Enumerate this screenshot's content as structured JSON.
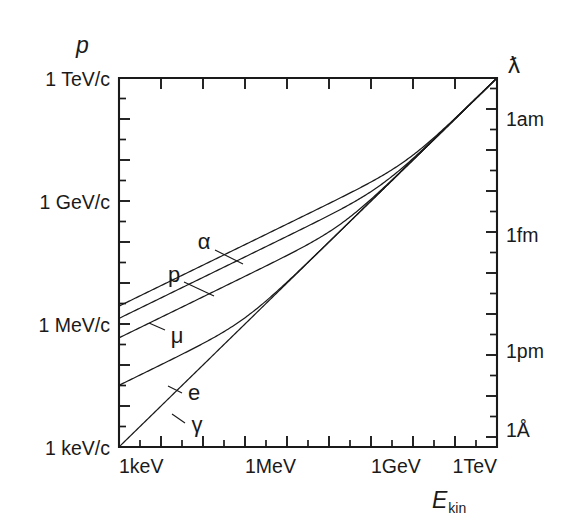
{
  "figure": {
    "background_color": "#ffffff",
    "line_color": "#1a1a1a"
  },
  "axes": {
    "y_left": {
      "title": "p",
      "labels": [
        "1 TeV/c",
        "1 GeV/c",
        "1 MeV/c",
        "1 keV/c"
      ],
      "decade_values": [
        1000000000,
        1000000,
        1000,
        1
      ]
    },
    "y_right": {
      "title": "ƛ",
      "labels": [
        "1am",
        "1fm",
        "1pm",
        "1Å"
      ]
    },
    "x_bottom": {
      "title_main": "E",
      "title_sub": "kin",
      "labels": [
        "1keV",
        "1MeV",
        "1GeV",
        "1TeV"
      ]
    }
  },
  "curve_labels": {
    "alpha": "α",
    "proton": "p",
    "muon": "μ",
    "electron": "e",
    "photon": "γ"
  },
  "chart_data": {
    "type": "line",
    "title": "",
    "xlabel": "E_kin",
    "ylabel": "p",
    "xscale": "log",
    "yscale": "log",
    "xlim": [
      1000,
      1000000000000
    ],
    "ylim": [
      1000,
      1000000000000
    ],
    "xtick_labels": [
      "1keV",
      "1MeV",
      "1GeV",
      "1TeV"
    ],
    "xtick_values": [
      1000,
      1000000,
      1000000000,
      1000000000000
    ],
    "ytick_labels": [
      "1 keV/c",
      "1 MeV/c",
      "1 GeV/c",
      "1 TeV/c"
    ],
    "ytick_values": [
      1000,
      1000000,
      1000000000,
      1000000000000
    ],
    "y2tick_labels": [
      "1Å",
      "1pm",
      "1fm",
      "1am"
    ],
    "grid": false,
    "legend": "inline-curve-labels",
    "minor_ticks_per_decade": 1,
    "note": "Momentum p = sqrt(T^2 + 2*T*m*c^2)/c versus kinetic energy T for five particles; right axis is reduced wavelength lambda-bar = hbar/p.",
    "series": [
      {
        "name": "α",
        "rest_mass_MeV": 3727.0,
        "x": [
          1000,
          3162,
          10000,
          31620,
          100000,
          316200,
          1000000,
          3162000,
          10000000,
          31620000,
          100000000,
          316200000,
          1000000000,
          3162000000,
          10000000000,
          31620000000,
          100000000000,
          316200000000,
          1000000000000
        ],
        "y": [
          2730000,
          4855000,
          8634000,
          15350000,
          27300000,
          48550000,
          86340000,
          153500000,
          273000000,
          485800000,
          866200000,
          1560000000,
          2880000000,
          5730000000,
          13120000000,
          34700000000,
          103000000000,
          317000000000,
          1000000000000
        ]
      },
      {
        "name": "p",
        "rest_mass_MeV": 938.3,
        "x": [
          1000,
          3162,
          10000,
          31620,
          100000,
          316200,
          1000000,
          3162000,
          10000000,
          31620000,
          100000000,
          316200000,
          1000000000,
          3162000000,
          10000000000,
          31620000000,
          100000000000,
          316200000000,
          1000000000000
        ],
        "y": [
          1370000,
          2436000,
          4332000,
          7702000,
          13700000,
          24360000,
          43330000,
          77060000,
          137100000,
          243900000,
          435300000,
          783600000,
          1452000000,
          3040000000,
          8000000000,
          26900000000,
          96100000000,
          314000000000,
          1000000000000
        ]
      },
      {
        "name": "μ",
        "rest_mass_MeV": 105.66,
        "x": [
          1000,
          3162,
          10000,
          31620,
          100000,
          316200,
          1000000,
          3162000,
          10000000,
          31620000,
          100000000,
          316200000,
          1000000000,
          3162000000,
          10000000000,
          31620000000,
          100000000000,
          316200000000,
          1000000000000
        ],
        "y": [
          460000,
          818000,
          1454000,
          2585000,
          4598000,
          8175000,
          14540000,
          25860000,
          46060000,
          82130000,
          147300000,
          272800000,
          557900000,
          1400000000,
          4620000000,
          20500000000,
          89400000000,
          310000000000,
          1000000000000
        ]
      },
      {
        "name": "e",
        "rest_mass_MeV": 0.511,
        "x": [
          1000,
          3162,
          10000,
          31620,
          100000,
          316200,
          1000000,
          3162000,
          10000000,
          31620000,
          100000000,
          316200000,
          1000000000,
          3162000000,
          10000000000,
          31620000000,
          100000000000,
          316200000000,
          1000000000000
        ],
        "y": [
          32000,
          56900,
          101500,
          181600,
          327000,
          601000,
          1422000,
          3590000,
          10470000,
          31740000,
          100100000,
          316300000,
          1000000000,
          3162000000,
          10000000000,
          31620000000,
          100000000000,
          316200000000,
          1000000000000
        ]
      },
      {
        "name": "γ",
        "rest_mass_MeV": 0,
        "x": [
          1000,
          1000000,
          1000000000,
          1000000000000
        ],
        "y": [
          1000,
          1000000,
          1000000000,
          1000000000000
        ]
      }
    ]
  }
}
